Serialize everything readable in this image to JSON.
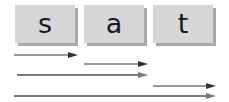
{
  "tiles": [
    {
      "letter": "s"
    },
    {
      "letter": "a"
    },
    {
      "letter": "t"
    }
  ],
  "colors": {
    "tile_bg": "#d6d6d6",
    "tile_shadow": "#a9a9a9",
    "arrow_dark": "#333333",
    "arrow_gray": "#7a7a7a"
  },
  "arrows": [
    {
      "from": "s",
      "to": "s",
      "style": "thin-dark"
    },
    {
      "from": "a",
      "to": "a",
      "style": "thin-dark"
    },
    {
      "from": "s",
      "to": "a",
      "style": "thick-gray"
    },
    {
      "from": "t",
      "to": "t",
      "style": "thin-dark"
    },
    {
      "from": "s",
      "to": "t",
      "style": "thick-gray"
    }
  ]
}
